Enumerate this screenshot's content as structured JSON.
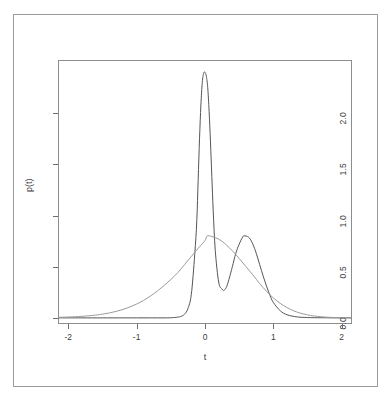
{
  "chart_data": {
    "type": "line",
    "title": "",
    "xlabel": "t",
    "ylabel": "p(t)",
    "xlim": [
      -2.15,
      2.15
    ],
    "ylim": [
      -0.06,
      2.52
    ],
    "xticks": [
      -2,
      -1,
      0,
      1,
      2
    ],
    "xtick_labels": [
      "-2",
      "-1",
      "0",
      "1",
      "2"
    ],
    "yticks": [
      0.0,
      0.5,
      1.0,
      1.5,
      2.0
    ],
    "ytick_labels": [
      "0.0",
      "0.5",
      "1.0",
      "1.5",
      "2.0"
    ],
    "grid": false,
    "legend": false,
    "legend_position": "none",
    "box": true,
    "series": [
      {
        "name": "bimodal-density",
        "color": "#555555",
        "style": "solid",
        "description": "Sharp narrow mode at t=0 (peak 2.40) plus broad secondary mode at t=0.57 (peak 0.80), valley at t=0.28 (0.27)",
        "mixture": [
          {
            "weight": 0.34,
            "mean": 0.0,
            "sd": 0.055
          },
          {
            "weight": 0.66,
            "mean": 0.57,
            "sd": 0.205
          }
        ],
        "x": [
          -2.15,
          -1.8,
          -1.5,
          -1.2,
          -1.0,
          -0.8,
          -0.6,
          -0.5,
          -0.4,
          -0.35,
          -0.3,
          -0.25,
          -0.2,
          -0.15,
          -0.12,
          -0.1,
          -0.08,
          -0.06,
          -0.04,
          -0.02,
          0.0,
          0.02,
          0.04,
          0.06,
          0.08,
          0.1,
          0.12,
          0.15,
          0.2,
          0.25,
          0.28,
          0.32,
          0.36,
          0.4,
          0.45,
          0.5,
          0.55,
          0.57,
          0.6,
          0.65,
          0.7,
          0.75,
          0.8,
          0.85,
          0.9,
          0.95,
          1.0,
          1.1,
          1.2,
          1.35,
          1.5,
          1.7,
          1.9,
          2.15
        ],
        "y": [
          0.0,
          0.0,
          0.0,
          0.0,
          0.0,
          0.0,
          0.0,
          0.001,
          0.007,
          0.015,
          0.035,
          0.09,
          0.23,
          0.62,
          0.95,
          1.35,
          1.75,
          2.08,
          2.3,
          2.39,
          2.4,
          2.36,
          2.25,
          2.02,
          1.72,
          1.38,
          1.05,
          0.66,
          0.35,
          0.28,
          0.27,
          0.31,
          0.4,
          0.5,
          0.63,
          0.72,
          0.79,
          0.8,
          0.8,
          0.78,
          0.72,
          0.63,
          0.52,
          0.41,
          0.31,
          0.22,
          0.15,
          0.07,
          0.03,
          0.009,
          0.003,
          0.001,
          0.0,
          0.0
        ]
      },
      {
        "name": "broad-density",
        "color": "#9b9b9b",
        "style": "solid",
        "description": "Single broad unimodal density centered near t=0.03 with peak 0.80",
        "mixture": [
          {
            "weight": 1.0,
            "mean": 0.03,
            "sd": 0.5
          }
        ],
        "x": [
          -2.15,
          -2.0,
          -1.8,
          -1.6,
          -1.5,
          -1.4,
          -1.3,
          -1.2,
          -1.1,
          -1.0,
          -0.9,
          -0.8,
          -0.7,
          -0.6,
          -0.5,
          -0.4,
          -0.3,
          -0.2,
          -0.1,
          0.0,
          0.03,
          0.1,
          0.2,
          0.3,
          0.4,
          0.5,
          0.6,
          0.7,
          0.8,
          0.9,
          1.0,
          1.1,
          1.2,
          1.3,
          1.4,
          1.5,
          1.6,
          1.8,
          2.0,
          2.15
        ],
        "y": [
          0.005,
          0.008,
          0.015,
          0.027,
          0.036,
          0.048,
          0.063,
          0.082,
          0.106,
          0.135,
          0.17,
          0.212,
          0.26,
          0.315,
          0.375,
          0.44,
          0.52,
          0.6,
          0.68,
          0.755,
          0.8,
          0.795,
          0.77,
          0.72,
          0.655,
          0.58,
          0.5,
          0.42,
          0.335,
          0.26,
          0.195,
          0.142,
          0.1,
          0.068,
          0.045,
          0.029,
          0.018,
          0.006,
          0.002,
          0.001
        ]
      }
    ]
  },
  "axes": {
    "y_title": "p(t)",
    "x_title": "t"
  }
}
